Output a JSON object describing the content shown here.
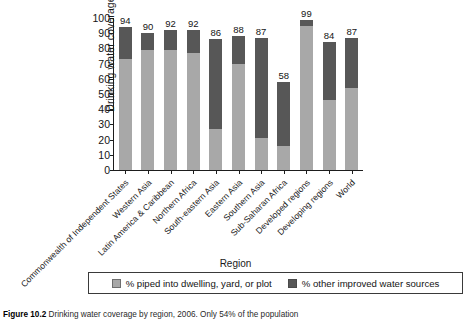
{
  "chart_data": {
    "type": "bar",
    "subtype": "stacked-vertical",
    "title": "",
    "xlabel": "Region",
    "ylabel": "Drinking water coverage",
    "ylim": [
      0,
      100
    ],
    "yticks": [
      0,
      10,
      20,
      30,
      40,
      50,
      60,
      70,
      80,
      90,
      100
    ],
    "grid": false,
    "legend_position": "bottom",
    "categories": [
      "Commonwealth of Independent States",
      "Western Asia",
      "Latin America & Caribbean",
      "Northern Africa",
      "South-eastern Asia",
      "Eastern Asia",
      "Southern Asia",
      "Sub-Saharan Africa",
      "Developed regions",
      "Developing regions",
      "World"
    ],
    "series": [
      {
        "name": "% piped into dwelling, yard, or plot",
        "color": "#a8a8a8",
        "values": [
          73,
          79,
          79,
          77,
          27,
          70,
          21,
          16,
          95,
          46,
          54
        ]
      },
      {
        "name": "% other improved water sources",
        "color": "#575757",
        "values": [
          21,
          11,
          13,
          15,
          59,
          18,
          66,
          42,
          4,
          38,
          33
        ]
      }
    ],
    "totals": [
      94,
      90,
      92,
      92,
      86,
      88,
      87,
      58,
      99,
      84,
      87
    ],
    "total_labels": [
      "94",
      "90",
      "92",
      "92",
      "86",
      "88",
      "87",
      "58",
      "99",
      "84",
      "87"
    ]
  },
  "axes": {
    "y_title": "Drinking water coverage",
    "x_title": "Region",
    "y_tick_labels": [
      "100",
      "90",
      "80",
      "70",
      "60",
      "50",
      "40",
      "30",
      "20",
      "10",
      "0"
    ]
  },
  "legend": {
    "items": [
      {
        "label": "% piped into dwelling, yard, or plot",
        "swatch": "light-gray-swatch"
      },
      {
        "label": "% other improved water sources",
        "swatch": "dark-gray-swatch"
      }
    ]
  },
  "caption": {
    "figure_number": "Figure 10.2",
    "text": "Drinking water coverage by region, 2006. Only 54% of the population"
  },
  "colors": {
    "piped": "#a8a8a8",
    "other": "#575757",
    "axis": "#1d1d1d",
    "text": "#141414",
    "background": "#ffffff"
  }
}
